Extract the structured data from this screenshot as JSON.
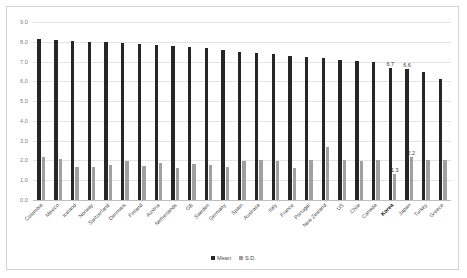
{
  "chart_data": {
    "type": "bar",
    "title": "",
    "subtitle": "",
    "xlabel": "",
    "ylabel": "",
    "ylim": [
      0.0,
      9.0
    ],
    "ytick_step": 1.0,
    "ytick_labels": [
      "9.0",
      "8.0",
      "7.0",
      "6.0",
      "5.0",
      "4.0",
      "3.0",
      "2.0",
      "1.0",
      "0.0"
    ],
    "grid": true,
    "legend_position": "bottom-center",
    "highlight_category": "Korea",
    "colors": {
      "mean": "#262626",
      "sd": "#a0a0a0",
      "grid": "#e4e4e4",
      "axis_text": "#808080",
      "frame": "#d2d2d2",
      "background": "#ffffff"
    },
    "categories": [
      "Colombia",
      "Mexico",
      "Iceland",
      "Norway",
      "Switzerland",
      "Denmark",
      "Finland",
      "Austria",
      "Netherlands",
      "GB",
      "Sweden",
      "Germany",
      "Spain",
      "Australia",
      "Italy",
      "France",
      "Portugal",
      "New Zealand",
      "US",
      "Chile",
      "Canada",
      "Korea",
      "Japan",
      "Turkey",
      "Greece"
    ],
    "series": [
      {
        "name": "Mean",
        "color": "#262626",
        "values": [
          8.15,
          8.1,
          8.05,
          8.0,
          8.0,
          7.95,
          7.9,
          7.85,
          7.8,
          7.75,
          7.7,
          7.6,
          7.5,
          7.45,
          7.4,
          7.3,
          7.25,
          7.2,
          7.1,
          7.05,
          7.0,
          6.7,
          6.6,
          6.45,
          6.1
        ]
      },
      {
        "name": "S.D.",
        "color": "#a0a0a0",
        "values": [
          2.15,
          2.05,
          1.65,
          1.65,
          1.75,
          1.95,
          1.7,
          1.85,
          1.6,
          1.8,
          1.75,
          1.65,
          1.95,
          2.0,
          1.95,
          1.6,
          2.0,
          2.7,
          2.0,
          1.95,
          2.0,
          1.3,
          2.2,
          2.0,
          2.0
        ]
      }
    ],
    "legend": [
      {
        "label": "Mean",
        "color": "#262626"
      },
      {
        "label": "S.D.",
        "color": "#a0a0a0"
      }
    ],
    "data_labels": [
      {
        "category": "Korea",
        "series": "Mean",
        "value": "6.7"
      },
      {
        "category": "Japan",
        "series": "Mean",
        "value": "6.6"
      },
      {
        "category": "Korea",
        "series": "S.D.",
        "value": "1.3"
      },
      {
        "category": "Japan",
        "series": "S.D.",
        "value": "2.2"
      }
    ]
  }
}
